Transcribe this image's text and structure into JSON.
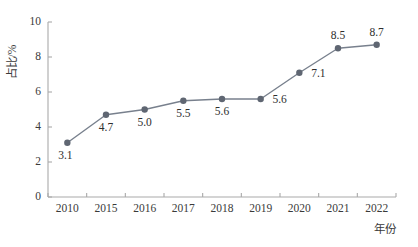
{
  "chart_data": {
    "type": "line",
    "title": "",
    "xlabel": "年份",
    "ylabel": "占比/%",
    "categories": [
      "2010",
      "2015",
      "2016",
      "2017",
      "2018",
      "2019",
      "2020",
      "2021",
      "2022"
    ],
    "values": [
      3.1,
      4.7,
      5.0,
      5.5,
      5.6,
      5.6,
      7.1,
      8.5,
      8.7
    ],
    "point_labels": [
      "3.1",
      "4.7",
      "5.0",
      "5.5",
      "5.6",
      "5.6",
      "7.1",
      "8.5",
      "8.7"
    ],
    "label_positions": [
      "below",
      "below",
      "below",
      "below",
      "below",
      "right",
      "right",
      "above",
      "above"
    ],
    "ylim": [
      0,
      10
    ],
    "yticks": [
      0,
      2,
      4,
      6,
      8,
      10
    ],
    "ytick_labels": [
      "0",
      "2",
      "4",
      "6",
      "8",
      "10"
    ],
    "grid": false,
    "legend": "none",
    "series": [
      {
        "name": "占比/%",
        "values": [
          3.1,
          4.7,
          5.0,
          5.5,
          5.6,
          5.6,
          7.1,
          8.5,
          8.7
        ],
        "line_color": "#78808d",
        "marker_color": "#5f6672",
        "marker": "circle"
      }
    ],
    "colors": {
      "line": "#78808d",
      "marker": "#5f6672",
      "axis": "#a9a9a9",
      "text": "#2e2e2e",
      "background": "#ffffff"
    }
  }
}
